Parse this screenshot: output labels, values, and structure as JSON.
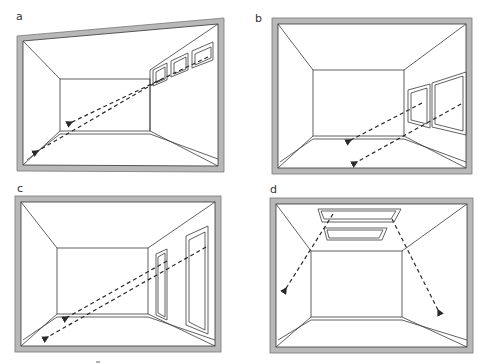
{
  "figure": {
    "panels": [
      {
        "label": "a",
        "window_type": "high clerestory windows on right wall",
        "window_count": 3,
        "ray_count": 2
      },
      {
        "label": "b",
        "window_type": "large windows on right wall",
        "window_count": 2,
        "ray_count": 2
      },
      {
        "label": "c",
        "window_type": "tall full-height windows on right wall",
        "window_count": 2,
        "ray_count": 2
      },
      {
        "label": "d",
        "window_type": "skylights in ceiling",
        "window_count": 2,
        "ray_count": 2
      }
    ],
    "colors": {
      "frame": "#b8b8b8",
      "lines": "#3a3a3a",
      "rays": "#2a2a2a",
      "background": "#ffffff"
    }
  }
}
